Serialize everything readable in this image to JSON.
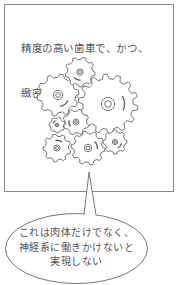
{
  "panel": {
    "caption_lines": [
      "精度の高い歯車で、かつ、",
      "緻密な構成。"
    ]
  },
  "illustration": {
    "icon": "gears-icon",
    "gears": [
      {
        "cx": 108,
        "cy": 104,
        "r": 30,
        "teeth": 14
      },
      {
        "cx": 58,
        "cy": 95,
        "r": 21,
        "teeth": 10
      },
      {
        "cx": 80,
        "cy": 72,
        "r": 15,
        "teeth": 9
      },
      {
        "cx": 76,
        "cy": 122,
        "r": 13,
        "teeth": 8
      },
      {
        "cx": 57,
        "cy": 125,
        "r": 8,
        "teeth": 7
      },
      {
        "cx": 57,
        "cy": 148,
        "r": 14,
        "teeth": 9
      },
      {
        "cx": 88,
        "cy": 148,
        "r": 17,
        "teeth": 10
      },
      {
        "cx": 115,
        "cy": 142,
        "r": 12,
        "teeth": 8
      }
    ],
    "stroke": "#666666"
  },
  "bubble": {
    "lines": [
      "これは肉体だけでなく、",
      "神経系に働きかけないと",
      "実現しない"
    ],
    "stroke": "#777777"
  }
}
